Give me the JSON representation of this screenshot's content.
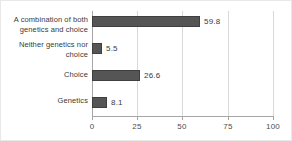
{
  "chart_data": {
    "type": "bar",
    "orientation": "horizontal",
    "title": "",
    "xlabel": "",
    "ylabel": "",
    "xlim": [
      0,
      100
    ],
    "xticks": [
      "0",
      "25",
      "50",
      "75",
      "100"
    ],
    "grid": true,
    "legend": false,
    "categories": [
      "A combination of both genetics and choice",
      "Neither genetics nor choice",
      "Choice",
      "Genetics"
    ],
    "category_lines": [
      [
        "A combination of both",
        "genetics and choice"
      ],
      [
        "Neither genetics nor",
        "choice"
      ],
      [
        "Choice"
      ],
      [
        "Genetics"
      ]
    ],
    "values": [
      59.8,
      5.5,
      26.6,
      8.1
    ],
    "value_labels": [
      "59.8",
      "5.5",
      "26.6",
      "8.1"
    ],
    "bar_color": "#555555",
    "bar_border_color": "#3f3f3f",
    "gridline_color": "#d9d9d9",
    "axis_color": "#a6a6a6",
    "text_color": "#3a3a3a"
  }
}
